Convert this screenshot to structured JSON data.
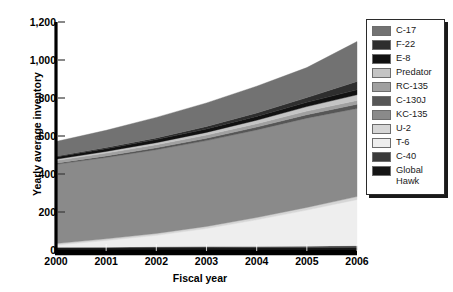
{
  "chart_data": {
    "type": "area",
    "title": "",
    "xlabel": "Fiscal year",
    "ylabel": "Yearly average inventory",
    "stacked": true,
    "grid": false,
    "legend_position": "right",
    "categories": [
      "2000",
      "2001",
      "2002",
      "2003",
      "2004",
      "2005",
      "2006"
    ],
    "x": [
      2000,
      2001,
      2002,
      2003,
      2004,
      2005,
      2006
    ],
    "xlim": [
      2000,
      2006
    ],
    "ylim": [
      0,
      1200
    ],
    "ytick_labels": [
      "0",
      "200",
      "400",
      "600",
      "800",
      "1,000",
      "1,200"
    ],
    "ytick_values": [
      0,
      200,
      400,
      600,
      800,
      1000,
      1200
    ],
    "xtick_labels": [
      "2000",
      "2001",
      "2002",
      "2003",
      "2004",
      "2005",
      "2006"
    ],
    "series": [
      {
        "name": "Global Hawk",
        "color": "#151515",
        "values": [
          10,
          10,
          11,
          11,
          12,
          12,
          13
        ]
      },
      {
        "name": "C-40",
        "color": "#3a3a3a",
        "values": [
          4,
          5,
          6,
          7,
          7,
          8,
          9
        ]
      },
      {
        "name": "T-6",
        "color": "#eeeeee",
        "values": [
          12,
          35,
          60,
          95,
          140,
          190,
          243
        ]
      },
      {
        "name": "U-2",
        "color": "#d6d6d6",
        "values": [
          8,
          9,
          10,
          11,
          12,
          14,
          16
        ]
      },
      {
        "name": "KC-135",
        "color": "#8a8a8a",
        "values": [
          417,
          428,
          441,
          452,
          461,
          470,
          464
        ]
      },
      {
        "name": "C-130J",
        "color": "#565656",
        "values": [
          6,
          8,
          10,
          12,
          15,
          18,
          22
        ]
      },
      {
        "name": "RC-135",
        "color": "#a0a0a0",
        "values": [
          14,
          15,
          16,
          17,
          18,
          19,
          20
        ]
      },
      {
        "name": "Predator",
        "color": "#c4c4c4",
        "values": [
          7,
          9,
          11,
          14,
          18,
          24,
          30
        ]
      },
      {
        "name": "E-8",
        "color": "#111111",
        "values": [
          12,
          14,
          16,
          18,
          20,
          22,
          26
        ]
      },
      {
        "name": "F-22",
        "color": "#2e2e2e",
        "values": [
          4,
          6,
          9,
          13,
          18,
          25,
          44
        ]
      },
      {
        "name": "C-17",
        "color": "#727272",
        "values": [
          77,
          91,
          108,
          124,
          141,
          158,
          210
        ]
      }
    ]
  },
  "axes": {
    "y_title": "Yearly average inventory",
    "x_title": "Fiscal year",
    "y_ticks": [
      "1,200",
      "1,000",
      "800",
      "600",
      "400",
      "200",
      "0"
    ],
    "x_ticks": [
      "2000",
      "2001",
      "2002",
      "2003",
      "2004",
      "2005",
      "2006"
    ]
  },
  "legend": {
    "items": [
      {
        "label": "C-17",
        "color": "#727272"
      },
      {
        "label": "F-22",
        "color": "#2e2e2e"
      },
      {
        "label": "E-8",
        "color": "#111111"
      },
      {
        "label": "Predator",
        "color": "#c4c4c4"
      },
      {
        "label": "RC-135",
        "color": "#a0a0a0"
      },
      {
        "label": "C-130J",
        "color": "#565656"
      },
      {
        "label": "KC-135",
        "color": "#8a8a8a"
      },
      {
        "label": "U-2",
        "color": "#d6d6d6"
      },
      {
        "label": "T-6",
        "color": "#eeeeee"
      },
      {
        "label": "C-40",
        "color": "#3a3a3a"
      },
      {
        "label": "Global Hawk",
        "color": "#151515"
      }
    ]
  },
  "colors": {
    "axis": "#000000",
    "background": "#ffffff",
    "legend_border": "#2b2b2b",
    "legend_shadow": "#1a1a1a"
  }
}
